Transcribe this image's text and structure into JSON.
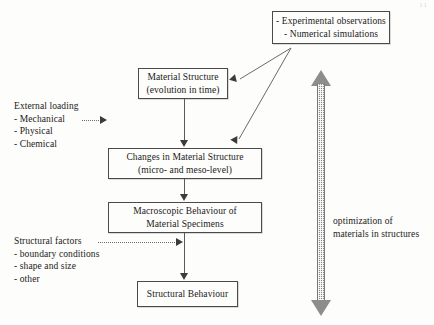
{
  "diagram": {
    "page_mark": "11",
    "boxes": [
      {
        "id": "sources",
        "name": "box-experimental-sources",
        "lines": [
          "- Experimental observations",
          "- Numerical simulations"
        ]
      },
      {
        "id": "material",
        "name": "box-material-structure",
        "lines": [
          "Material Structure",
          "(evolution in time)"
        ]
      },
      {
        "id": "changes",
        "name": "box-changes-in-material-structure",
        "lines": [
          "Changes in Material Structure",
          "(micro- and meso-level)"
        ]
      },
      {
        "id": "macro",
        "name": "box-macroscopic-behaviour",
        "lines": [
          "Macroscopic Behaviour of",
          "Material  Specimens"
        ]
      },
      {
        "id": "structural",
        "name": "box-structural-behaviour",
        "lines": [
          "Structural Behaviour"
        ]
      }
    ],
    "labels": {
      "external_loading": {
        "heading": "External loading",
        "items": [
          "- Mechanical",
          "- Physical",
          "- Chemical"
        ]
      },
      "structural_factors": {
        "heading": "Structural factors",
        "items": [
          "- boundary conditions",
          "- shape and size",
          "- other"
        ]
      },
      "optimization": {
        "lines": [
          "optimization of",
          "materials in structures"
        ]
      }
    },
    "connectors": [
      {
        "name": "arrow-material-to-changes",
        "style": "solid",
        "direction": "down"
      },
      {
        "name": "arrow-changes-to-macro",
        "style": "solid",
        "direction": "down"
      },
      {
        "name": "arrow-macro-to-structural",
        "style": "solid",
        "direction": "down"
      },
      {
        "name": "arrow-sources-to-material",
        "style": "solid",
        "direction": "diagonal-left-up"
      },
      {
        "name": "arrow-sources-to-changes",
        "style": "solid",
        "direction": "diagonal-left-down"
      },
      {
        "name": "arrow-external-loading",
        "style": "dotted",
        "direction": "right"
      },
      {
        "name": "arrow-structural-factors",
        "style": "dotted",
        "direction": "right"
      },
      {
        "name": "arrow-optimization",
        "style": "halftone",
        "direction": "double-vertical"
      }
    ],
    "colors": {
      "background": "#fdfdfb",
      "box_border": "#4a4a4a",
      "line": "#5a5a5a",
      "arrowhead": "#3c3c3c",
      "optimization_arrow": "#8d8d8d",
      "text": "#1a1a1a"
    }
  }
}
